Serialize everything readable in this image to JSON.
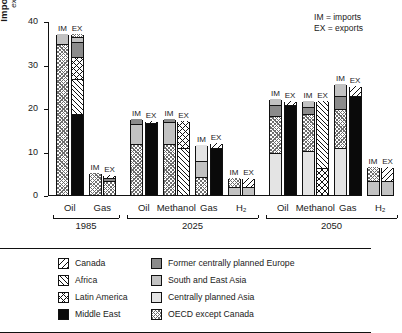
{
  "annotation": {
    "line1": "IM = imports",
    "line2": "EX = exports"
  },
  "axis": {
    "ylabel_main": "Imports and exports",
    "ylabel_sub": "exajoules per year",
    "yticks": [
      "0",
      "10",
      "20",
      "30",
      "40"
    ]
  },
  "legend": {
    "column1": [
      {
        "label": "Canada",
        "pattern": "p-canada"
      },
      {
        "label": "Africa",
        "pattern": "p-africa"
      },
      {
        "label": "Latin America",
        "pattern": "p-latin"
      },
      {
        "label": "Middle East",
        "pattern": "p-mideast"
      }
    ],
    "column2": [
      {
        "label": "Former centrally planned Europe",
        "pattern": "p-fceurope"
      },
      {
        "label": "South and East Asia",
        "pattern": "p-seasia"
      },
      {
        "label": "Centrally planned Asia",
        "pattern": "p-cpasia"
      },
      {
        "label": "OECD except Canada",
        "pattern": "p-oecd"
      }
    ]
  },
  "chart_data": {
    "type": "bar",
    "title": "",
    "xlabel": "",
    "ylabel": "Imports and exports (exajoules per year)",
    "ylim": [
      0,
      40
    ],
    "yticks": [
      0,
      10,
      20,
      30,
      40
    ],
    "grid": false,
    "stacked": true,
    "legend_position": "below-plot",
    "regions": [
      "Canada",
      "Africa",
      "Latin America",
      "Middle East",
      "Former centrally planned Europe",
      "South and East Asia",
      "Centrally planned Asia",
      "OECD except Canada"
    ],
    "groups": [
      {
        "year": "1985",
        "fuels": [
          {
            "fuel": "Oil",
            "bars": [
              {
                "kind": "IM",
                "total": 37.0,
                "segments": [
                  {
                    "region": "OECD except Canada",
                    "value": 34.5
                  },
                  {
                    "region": "South and East Asia",
                    "value": 2.5
                  }
                ]
              },
              {
                "kind": "EX",
                "total": 37.0,
                "segments": [
                  {
                    "region": "Middle East",
                    "value": 18.5
                  },
                  {
                    "region": "Africa",
                    "value": 8.0
                  },
                  {
                    "region": "Latin America",
                    "value": 5.0
                  },
                  {
                    "region": "Former centrally planned Europe",
                    "value": 3.5
                  },
                  {
                    "region": "South and East Asia",
                    "value": 1.0
                  },
                  {
                    "region": "OECD except Canada",
                    "value": 1.0
                  }
                ]
              }
            ]
          },
          {
            "fuel": "Gas",
            "bars": [
              {
                "kind": "IM",
                "total": 5.0,
                "segments": [
                  {
                    "region": "OECD except Canada",
                    "value": 5.0
                  }
                ]
              },
              {
                "kind": "EX",
                "total": 4.7,
                "segments": [
                  {
                    "region": "OECD except Canada",
                    "value": 3.0
                  },
                  {
                    "region": "Former centrally planned Europe",
                    "value": 0.7
                  },
                  {
                    "region": "Canada",
                    "value": 1.0
                  }
                ]
              }
            ]
          }
        ]
      },
      {
        "year": "2025",
        "fuels": [
          {
            "fuel": "Oil",
            "bars": [
              {
                "kind": "IM",
                "total": 17.5,
                "segments": [
                  {
                    "region": "OECD except Canada",
                    "value": 11.5
                  },
                  {
                    "region": "South and East Asia",
                    "value": 4.5
                  },
                  {
                    "region": "Former centrally planned Europe",
                    "value": 1.5
                  }
                ]
              },
              {
                "kind": "EX",
                "total": 17.0,
                "segments": [
                  {
                    "region": "Middle East",
                    "value": 16.3
                  },
                  {
                    "region": "Canada",
                    "value": 0.7
                  }
                ]
              }
            ]
          },
          {
            "fuel": "Methanol",
            "bars": [
              {
                "kind": "IM",
                "total": 17.5,
                "segments": [
                  {
                    "region": "OECD except Canada",
                    "value": 11.5
                  },
                  {
                    "region": "South and East Asia",
                    "value": 5.0
                  },
                  {
                    "region": "Former centrally planned Europe",
                    "value": 1.0
                  }
                ]
              },
              {
                "kind": "EX",
                "total": 17.0,
                "segments": [
                  {
                    "region": "Africa",
                    "value": 10.5
                  },
                  {
                    "region": "Latin America",
                    "value": 6.5
                  }
                ]
              }
            ]
          },
          {
            "fuel": "Gas",
            "bars": [
              {
                "kind": "IM",
                "total": 11.5,
                "segments": [
                  {
                    "region": "OECD except Canada",
                    "value": 4.0
                  },
                  {
                    "region": "South and East Asia",
                    "value": 3.5
                  },
                  {
                    "region": "Centrally planned Asia",
                    "value": 4.0
                  }
                ]
              },
              {
                "kind": "EX",
                "total": 12.0,
                "segments": [
                  {
                    "region": "Middle East",
                    "value": 10.5
                  },
                  {
                    "region": "Canada",
                    "value": 1.5
                  }
                ]
              }
            ]
          },
          {
            "fuel": "H₂",
            "bars": [
              {
                "kind": "IM",
                "total": 4.0,
                "segments": [
                  {
                    "region": "South and East Asia",
                    "value": 1.5
                  },
                  {
                    "region": "OECD except Canada",
                    "value": 2.5
                  }
                ]
              },
              {
                "kind": "EX",
                "total": 4.0,
                "segments": [
                  {
                    "region": "South and East Asia",
                    "value": 1.5
                  },
                  {
                    "region": "Canada",
                    "value": 2.5
                  }
                ]
              }
            ]
          }
        ]
      },
      {
        "year": "2050",
        "fuels": [
          {
            "fuel": "Oil",
            "bars": [
              {
                "kind": "IM",
                "total": 22.0,
                "segments": [
                  {
                    "region": "Centrally planned Asia",
                    "value": 9.5
                  },
                  {
                    "region": "OECD except Canada",
                    "value": 8.5
                  },
                  {
                    "region": "Former centrally planned Europe",
                    "value": 2.5
                  },
                  {
                    "region": "South and East Asia",
                    "value": 1.5
                  }
                ]
              },
              {
                "kind": "EX",
                "total": 21.5,
                "segments": [
                  {
                    "region": "Middle East",
                    "value": 20.5
                  },
                  {
                    "region": "Canada",
                    "value": 1.0
                  }
                ]
              }
            ]
          },
          {
            "fuel": "Methanol",
            "bars": [
              {
                "kind": "IM",
                "total": 21.5,
                "segments": [
                  {
                    "region": "Centrally planned Asia",
                    "value": 10.0
                  },
                  {
                    "region": "OECD except Canada",
                    "value": 8.5
                  },
                  {
                    "region": "Former centrally planned Europe",
                    "value": 1.5
                  },
                  {
                    "region": "South and East Asia",
                    "value": 1.5
                  }
                ]
              },
              {
                "kind": "EX",
                "total": 21.5,
                "segments": [
                  {
                    "region": "Latin America",
                    "value": 6.0
                  },
                  {
                    "region": "Africa",
                    "value": 15.5
                  }
                ]
              }
            ]
          },
          {
            "fuel": "Gas",
            "bars": [
              {
                "kind": "IM",
                "total": 25.5,
                "segments": [
                  {
                    "region": "Centrally planned Asia",
                    "value": 10.5
                  },
                  {
                    "region": "OECD except Canada",
                    "value": 9.0
                  },
                  {
                    "region": "Former centrally planned Europe",
                    "value": 3.0
                  },
                  {
                    "region": "South and East Asia",
                    "value": 3.0
                  }
                ]
              },
              {
                "kind": "EX",
                "total": 25.0,
                "segments": [
                  {
                    "region": "Middle East",
                    "value": 22.5
                  },
                  {
                    "region": "Canada",
                    "value": 2.5
                  }
                ]
              }
            ]
          },
          {
            "fuel": "H₂",
            "bars": [
              {
                "kind": "IM",
                "total": 6.5,
                "segments": [
                  {
                    "region": "South and East Asia",
                    "value": 3.0
                  },
                  {
                    "region": "OECD except Canada",
                    "value": 3.5
                  }
                ]
              },
              {
                "kind": "EX",
                "total": 6.5,
                "segments": [
                  {
                    "region": "South and East Asia",
                    "value": 3.0
                  },
                  {
                    "region": "Canada",
                    "value": 3.5
                  }
                ]
              }
            ]
          }
        ]
      }
    ]
  }
}
